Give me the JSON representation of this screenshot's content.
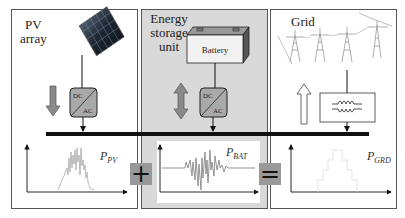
{
  "panels": {
    "pv": {
      "title_line1": "PV",
      "title_line2": "array",
      "plot_label": "P",
      "plot_sub": "PV",
      "converter": {
        "top": "DC",
        "bottom": "AC"
      },
      "flow_arrow": "down"
    },
    "ess": {
      "title_line1": "Energy",
      "title_line2": "storage",
      "title_line3": "unit",
      "device_label": "Battery",
      "plot_label": "P",
      "plot_sub": "BAT",
      "converter": {
        "top": "DC",
        "bottom": "AC"
      },
      "flow_arrow": "bidirectional"
    },
    "grid": {
      "title": "Grid",
      "plot_label": "P",
      "plot_sub": "GRD",
      "device": "transformer-icon",
      "flow_arrow": "up"
    }
  },
  "operators": {
    "plus": "+",
    "equals": "="
  },
  "colors": {
    "ess_background": "#d9d9d9",
    "bus": "#111111",
    "arrow_fill": "#8a8a8a",
    "grid_arrow_fill": "#ffffff",
    "signal": "#999999",
    "operator_bg": "#999999"
  }
}
